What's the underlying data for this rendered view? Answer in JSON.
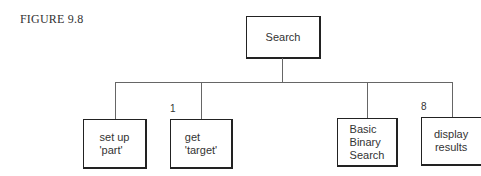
{
  "figure": {
    "label": "FIGURE 9.8"
  },
  "root": {
    "label": "Search"
  },
  "children": [
    {
      "label": "set up\n'part'",
      "number": ""
    },
    {
      "label": "get\n'target'",
      "number": "1"
    },
    {
      "label": "Basic\nBinary\nSearch",
      "number": ""
    },
    {
      "label": "display\nresults",
      "number": "8"
    }
  ]
}
